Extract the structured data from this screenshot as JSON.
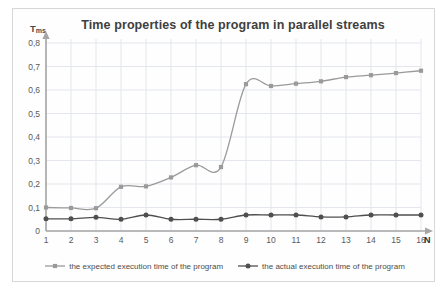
{
  "chart_data": {
    "type": "line",
    "title": "Time properties of the program in parallel streams",
    "xlabel": "N",
    "ylabel": "T",
    "ylabel_sub": "ms",
    "x": [
      1,
      2,
      3,
      4,
      5,
      6,
      7,
      8,
      9,
      10,
      11,
      12,
      13,
      14,
      15,
      16
    ],
    "xtick_labels": [
      "1",
      "2",
      "3",
      "4",
      "5",
      "6",
      "7",
      "8",
      "9",
      "10",
      "11",
      "12",
      "13",
      "14",
      "15",
      "16"
    ],
    "ytick_labels": [
      "0",
      "0,1",
      "0,2",
      "0,3",
      "0,4",
      "0,5",
      "0,6",
      "0,7",
      "0,8"
    ],
    "ytick_values": [
      0,
      0.1,
      0.2,
      0.3,
      0.4,
      0.5,
      0.6,
      0.7,
      0.8
    ],
    "ylim": [
      0,
      0.8
    ],
    "xlim": [
      1,
      16
    ],
    "grid": true,
    "legend_position": "bottom",
    "series": [
      {
        "name": "the expected execution time of the program",
        "color": "#9a9a9a",
        "marker": "square",
        "values": [
          0.1,
          0.098,
          0.097,
          0.188,
          0.19,
          0.228,
          0.28,
          0.272,
          0.625,
          0.617,
          0.627,
          0.637,
          0.655,
          0.663,
          0.672,
          0.682
        ]
      },
      {
        "name": "the actual execution time of the program",
        "color": "#4f4f4f",
        "marker": "circle",
        "values": [
          0.052,
          0.052,
          0.058,
          0.05,
          0.068,
          0.05,
          0.05,
          0.05,
          0.068,
          0.068,
          0.068,
          0.06,
          0.06,
          0.068,
          0.068,
          0.068
        ]
      }
    ]
  }
}
